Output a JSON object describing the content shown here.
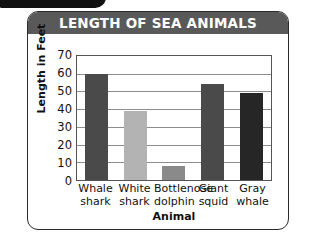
{
  "chart_data": {
    "type": "bar",
    "title": "LENGTH OF SEA ANIMALS",
    "xlabel": "Animal",
    "ylabel": "Length in Feet",
    "categories": [
      "Whale shark",
      "White shark",
      "Bottlenose dolphin",
      "Giant squid",
      "Gray whale"
    ],
    "category_lines": [
      [
        "Whale",
        "shark"
      ],
      [
        "White",
        "shark"
      ],
      [
        "Bottlenose",
        "dolphin"
      ],
      [
        "Giant",
        "squid"
      ],
      [
        "Gray",
        "whale"
      ]
    ],
    "values": [
      60,
      39,
      8,
      54,
      49
    ],
    "ylim": [
      0,
      70
    ],
    "ytick_values": [
      70,
      60,
      50,
      40,
      30,
      20,
      10,
      0
    ],
    "ytick_labels": [
      "70",
      "60",
      "50",
      "40",
      "30",
      "20",
      "10",
      "0"
    ],
    "grid": true,
    "legend": "none",
    "bar_colors": [
      "#4a4a4a",
      "#b3b3b3",
      "#8a8a8a",
      "#4a4a4a",
      "#262626"
    ]
  },
  "theme": {
    "title_bg": "#595959",
    "title_fg": "#ffffff",
    "card_border": "#2b2b2b",
    "grid_color": "#8d8d8d",
    "plot_border": "#555555",
    "text_color": "#111111",
    "page_bg": "#ffffff",
    "badge_color": "#111111"
  }
}
